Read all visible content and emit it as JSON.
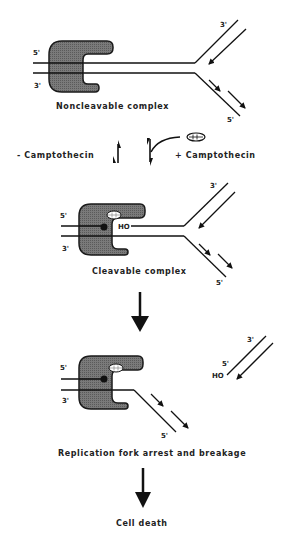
{
  "diagram": {
    "type": "mechanism-flowchart",
    "colors": {
      "line": "#111111",
      "enzyme_fill": "#6e6e6e",
      "enzyme_stroke": "#1a1a1a",
      "drug_fill": "#ffffff",
      "background": "#ffffff"
    },
    "panels": [
      {
        "id": "noncleavable",
        "caption": "Noncleavable complex",
        "labels": {
          "top_left": "5'",
          "bottom_left": "3'",
          "fork_top": "3'",
          "fork_bottom": "5'"
        }
      },
      {
        "id": "cleavable",
        "caption": "Cleavable complex",
        "labels": {
          "top_left": "5'",
          "bottom_left": "3'",
          "ho": "HO",
          "fork_top": "3'",
          "fork_bottom": "5'"
        }
      },
      {
        "id": "arrest",
        "caption": "Replication fork arrest and breakage",
        "labels": {
          "top_left": "5'",
          "bottom_left": "3'",
          "strand_bottom": "5'",
          "fragment_top": "3'",
          "fragment_5": "5'",
          "fragment_ho": "HO"
        }
      }
    ],
    "equilibrium": {
      "left_label": "- Camptothecin",
      "right_label": "+ Camptothecin"
    },
    "final": {
      "label": "Cell death"
    },
    "icons": [
      "topoisomerase-enzyme-shape",
      "camptothecin-drug-oval",
      "equilibrium-arrows",
      "down-arrow"
    ]
  }
}
